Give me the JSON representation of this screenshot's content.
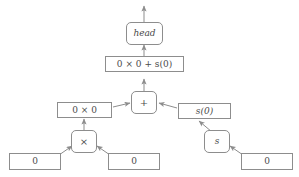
{
  "diagram": {
    "background_color": "#ffffff",
    "stroke_color": "#8d8d8d",
    "text_color": "#4a4a4a",
    "nodes": {
      "head": {
        "label": "head",
        "shape": "rounded-rect",
        "style": "italic"
      },
      "expression": {
        "label": "0 × 0 + s(0)",
        "shape": "rect"
      },
      "plus": {
        "label": "+",
        "shape": "rounded-rect"
      },
      "mul_expression": {
        "label": "0 × 0",
        "shape": "rect"
      },
      "succ_expression": {
        "label": "s(0)",
        "shape": "rect",
        "style": "italic"
      },
      "times": {
        "label": "×",
        "shape": "rounded-rect"
      },
      "succ": {
        "label": "s",
        "shape": "rounded-rect",
        "style": "italic"
      },
      "zero_left": {
        "label": "0",
        "shape": "rect"
      },
      "zero_middle": {
        "label": "0",
        "shape": "rect"
      },
      "zero_right": {
        "label": "0",
        "shape": "rect"
      }
    },
    "edges": [
      {
        "from": "head",
        "to": "output",
        "direction": "up"
      },
      {
        "from": "expression",
        "to": "head",
        "direction": "up"
      },
      {
        "from": "plus",
        "to": "expression",
        "direction": "up"
      },
      {
        "from": "mul_expression",
        "to": "plus",
        "direction": "right"
      },
      {
        "from": "succ_expression",
        "to": "plus",
        "direction": "left"
      },
      {
        "from": "times",
        "to": "mul_expression",
        "direction": "up"
      },
      {
        "from": "zero_left",
        "to": "times",
        "direction": "right"
      },
      {
        "from": "zero_middle",
        "to": "times",
        "direction": "left"
      },
      {
        "from": "succ",
        "to": "succ_expression",
        "direction": "up-left"
      },
      {
        "from": "zero_right",
        "to": "succ",
        "direction": "left"
      }
    ]
  }
}
